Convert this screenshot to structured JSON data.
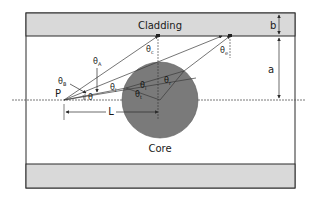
{
  "diagram": {
    "type": "fiber-geometry",
    "colors": {
      "cladding_fill": "#d9d9d9",
      "core_fill": "#7a7a7a",
      "outline": "#2b2b2b",
      "ray": "#3a3a3a",
      "background": "#ffffff"
    },
    "regions": {
      "cladding_top_label": "Cladding",
      "core_label": "Core"
    },
    "dimensions": {
      "b_label": "b",
      "a_label": "a",
      "L_label": "L"
    },
    "points": {
      "P_label": "P"
    },
    "angles": {
      "theta": "θ",
      "theta_A": "θ",
      "theta_A_sub": "A",
      "theta_B": "θ",
      "theta_B_sub": "B",
      "theta_c": "θ",
      "theta_c_sub": "c",
      "theta_e": "θ",
      "theta_e_sub": "e",
      "theta_i": "θ",
      "theta_i_sub": "i",
      "theta_t": "θ",
      "theta_t_sub": "t",
      "theta_r": "θ",
      "theta_r_sub": "r",
      "alpha": "α",
      "theta_l": "θ",
      "theta_l_sub": "l"
    }
  }
}
